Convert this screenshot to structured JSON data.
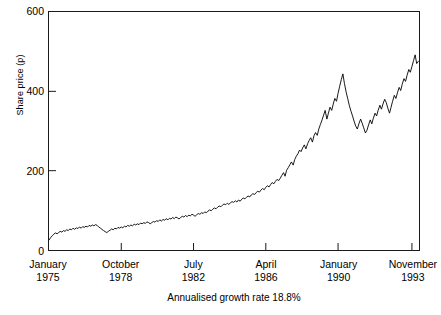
{
  "chart_data": {
    "type": "line",
    "title": "",
    "subtitle": "",
    "caption": "Annualised growth rate 18.8%",
    "xlabel": "",
    "ylabel": "Share price (p)",
    "ylim": [
      0,
      600
    ],
    "yticks": [
      0,
      200,
      400,
      600
    ],
    "ytick_labels": [
      "0",
      "200",
      "400",
      "600"
    ],
    "grid": false,
    "legend": null,
    "legend_position": "none",
    "xlim": [
      1975.0,
      1994.2
    ],
    "xticks": [
      1975.0,
      1978.75,
      1982.5,
      1986.25,
      1990.0,
      1993.833
    ],
    "xtick_labels": [
      {
        "month": "January",
        "year": "1975"
      },
      {
        "month": "October",
        "year": "1978"
      },
      {
        "month": "July",
        "year": "1982"
      },
      {
        "month": "April",
        "year": "1986"
      },
      {
        "month": "January",
        "year": "1990"
      },
      {
        "month": "November",
        "year": "1993"
      }
    ],
    "series": [
      {
        "name": "Share price",
        "color": "#000000",
        "x": [
          1975.0,
          1975.08,
          1975.17,
          1975.25,
          1975.33,
          1975.42,
          1975.5,
          1975.58,
          1975.67,
          1975.75,
          1975.83,
          1975.92,
          1976.0,
          1976.08,
          1976.17,
          1976.25,
          1976.33,
          1976.42,
          1976.5,
          1976.58,
          1976.67,
          1976.75,
          1976.83,
          1976.92,
          1977.0,
          1977.08,
          1977.17,
          1977.25,
          1977.33,
          1977.42,
          1977.5,
          1977.58,
          1977.67,
          1977.75,
          1977.83,
          1977.92,
          1978.0,
          1978.08,
          1978.17,
          1978.25,
          1978.33,
          1978.42,
          1978.5,
          1978.58,
          1978.67,
          1978.75,
          1978.83,
          1978.92,
          1979.0,
          1979.08,
          1979.17,
          1979.25,
          1979.33,
          1979.42,
          1979.5,
          1979.58,
          1979.67,
          1979.75,
          1979.83,
          1979.92,
          1980.0,
          1980.08,
          1980.17,
          1980.25,
          1980.33,
          1980.42,
          1980.5,
          1980.58,
          1980.67,
          1980.75,
          1980.83,
          1980.92,
          1981.0,
          1981.08,
          1981.17,
          1981.25,
          1981.33,
          1981.42,
          1981.5,
          1981.58,
          1981.67,
          1981.75,
          1981.83,
          1981.92,
          1982.0,
          1982.08,
          1982.17,
          1982.25,
          1982.33,
          1982.42,
          1982.5,
          1982.58,
          1982.67,
          1982.75,
          1982.83,
          1982.92,
          1983.0,
          1983.08,
          1983.17,
          1983.25,
          1983.33,
          1983.42,
          1983.5,
          1983.58,
          1983.67,
          1983.75,
          1983.83,
          1983.92,
          1984.0,
          1984.08,
          1984.17,
          1984.25,
          1984.33,
          1984.42,
          1984.5,
          1984.58,
          1984.67,
          1984.75,
          1984.83,
          1984.92,
          1985.0,
          1985.08,
          1985.17,
          1985.25,
          1985.33,
          1985.42,
          1985.5,
          1985.58,
          1985.67,
          1985.75,
          1985.83,
          1985.92,
          1986.0,
          1986.08,
          1986.17,
          1986.25,
          1986.33,
          1986.42,
          1986.5,
          1986.58,
          1986.67,
          1986.75,
          1986.83,
          1986.92,
          1987.0,
          1987.08,
          1987.17,
          1987.25,
          1987.33,
          1987.42,
          1987.5,
          1987.58,
          1987.67,
          1987.75,
          1987.83,
          1987.92,
          1988.0,
          1988.08,
          1988.17,
          1988.25,
          1988.33,
          1988.42,
          1988.5,
          1988.58,
          1988.67,
          1988.75,
          1988.83,
          1988.92,
          1989.0,
          1989.08,
          1989.17,
          1989.25,
          1989.33,
          1989.42,
          1989.5,
          1989.58,
          1989.67,
          1989.75,
          1989.83,
          1989.92,
          1990.0,
          1990.08,
          1990.17,
          1990.25,
          1990.33,
          1990.42,
          1990.5,
          1990.58,
          1990.67,
          1990.75,
          1990.83,
          1990.92,
          1991.0,
          1991.08,
          1991.17,
          1991.25,
          1991.33,
          1991.42,
          1991.5,
          1991.58,
          1991.67,
          1991.75,
          1991.83,
          1991.92,
          1992.0,
          1992.08,
          1992.17,
          1992.25,
          1992.33,
          1992.42,
          1992.5,
          1992.58,
          1992.67,
          1992.75,
          1992.83,
          1992.92,
          1993.0,
          1993.08,
          1993.17,
          1993.25,
          1993.33,
          1993.42,
          1993.5,
          1993.58,
          1993.67,
          1993.75,
          1993.83,
          1993.92,
          1994.0,
          1994.08,
          1994.17
        ],
        "values": [
          25,
          31,
          36,
          40,
          43,
          41,
          44,
          47,
          45,
          49,
          47,
          51,
          49,
          53,
          51,
          55,
          52,
          56,
          54,
          58,
          55,
          59,
          57,
          60,
          58,
          62,
          60,
          63,
          61,
          64,
          62,
          58,
          55,
          52,
          49,
          46,
          44,
          47,
          50,
          53,
          51,
          55,
          53,
          57,
          55,
          58,
          56,
          60,
          58,
          62,
          60,
          63,
          61,
          65,
          63,
          66,
          64,
          68,
          66,
          69,
          67,
          71,
          69,
          66,
          69,
          72,
          70,
          74,
          72,
          76,
          73,
          77,
          75,
          79,
          76,
          80,
          78,
          82,
          79,
          83,
          81,
          78,
          82,
          85,
          83,
          87,
          84,
          88,
          86,
          90,
          88,
          85,
          89,
          92,
          90,
          94,
          92,
          96,
          94,
          98,
          101,
          99,
          103,
          106,
          104,
          108,
          111,
          109,
          113,
          116,
          114,
          118,
          115,
          119,
          122,
          120,
          124,
          121,
          126,
          123,
          128,
          131,
          129,
          133,
          136,
          134,
          139,
          142,
          140,
          145,
          148,
          146,
          151,
          155,
          152,
          158,
          162,
          159,
          165,
          170,
          167,
          173,
          178,
          175,
          181,
          188,
          195,
          186,
          201,
          208,
          215,
          222,
          214,
          228,
          236,
          243,
          252,
          248,
          258,
          265,
          255,
          268,
          276,
          283,
          272,
          288,
          296,
          289,
          305,
          316,
          328,
          340,
          352,
          330,
          345,
          360,
          352,
          368,
          382,
          375,
          395,
          412,
          430,
          444,
          420,
          398,
          382,
          365,
          350,
          338,
          325,
          312,
          305,
          318,
          330,
          320,
          308,
          295,
          302,
          315,
          328,
          318,
          332,
          345,
          338,
          352,
          365,
          355,
          368,
          380,
          372,
          358,
          345,
          360,
          375,
          390,
          382,
          396,
          410,
          402,
          418,
          432,
          425,
          440,
          455,
          448,
          462,
          478,
          492,
          470,
          476
        ]
      }
    ]
  }
}
